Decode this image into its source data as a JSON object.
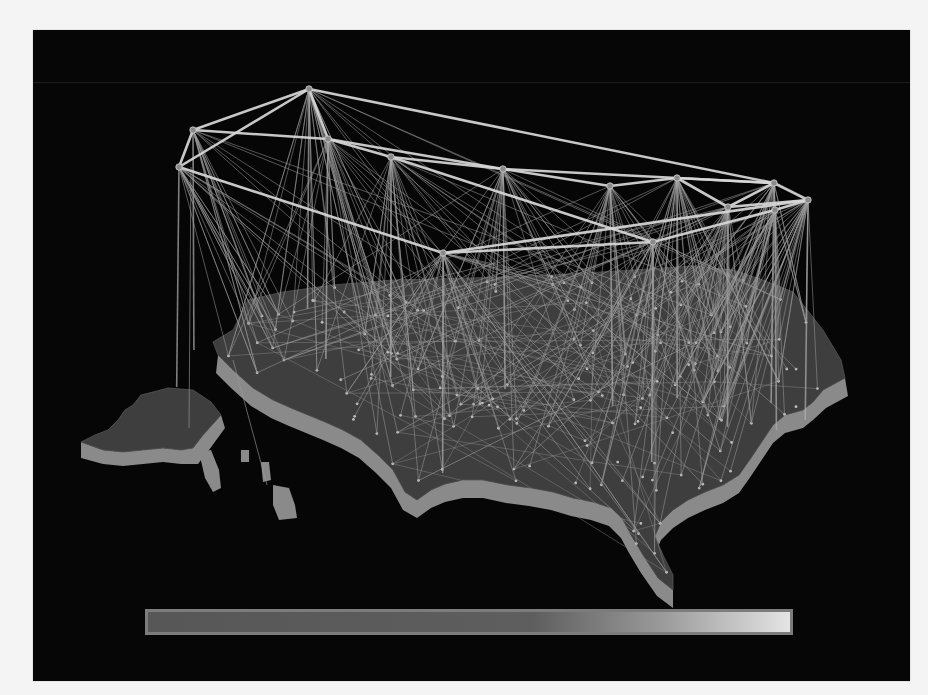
{
  "figure": {
    "type": "3d-network-map",
    "colors": {
      "background": "#060606",
      "page": "#f4f4f4",
      "map_top": "#3e3e3e",
      "map_side": "#8a8a8a",
      "backbone_link": "#d8d8d8",
      "fanout_link": "#9a9a9a",
      "ground_link": "#8c8c8c"
    }
  },
  "color_scale": {
    "stops": [
      {
        "offset": 0,
        "color": "#575757"
      },
      {
        "offset": 0.6,
        "color": "#5e5e5e"
      },
      {
        "offset": 0.8,
        "color": "#9a9a9a"
      },
      {
        "offset": 1,
        "color": "#e4e4e4"
      }
    ]
  },
  "backbone_nodes": [
    {
      "id": "n1",
      "x": 276,
      "y": 59
    },
    {
      "id": "n2",
      "x": 160,
      "y": 100
    },
    {
      "id": "n3",
      "x": 146,
      "y": 137
    },
    {
      "id": "n4",
      "x": 295,
      "y": 109
    },
    {
      "id": "n5",
      "x": 358,
      "y": 127
    },
    {
      "id": "n6",
      "x": 470,
      "y": 139
    },
    {
      "id": "n7",
      "x": 577,
      "y": 156
    },
    {
      "id": "n8",
      "x": 644,
      "y": 148
    },
    {
      "id": "n9",
      "x": 695,
      "y": 177
    },
    {
      "id": "n10",
      "x": 741,
      "y": 153
    },
    {
      "id": "n11",
      "x": 742,
      "y": 180
    },
    {
      "id": "n12",
      "x": 775,
      "y": 170
    },
    {
      "id": "n13",
      "x": 410,
      "y": 223
    },
    {
      "id": "n14",
      "x": 620,
      "y": 212
    }
  ],
  "backbone_links": [
    [
      "n1",
      "n2"
    ],
    [
      "n1",
      "n3"
    ],
    [
      "n1",
      "n4"
    ],
    [
      "n1",
      "n10"
    ],
    [
      "n2",
      "n3"
    ],
    [
      "n2",
      "n4"
    ],
    [
      "n3",
      "n13"
    ],
    [
      "n4",
      "n5"
    ],
    [
      "n4",
      "n6"
    ],
    [
      "n5",
      "n6"
    ],
    [
      "n6",
      "n7"
    ],
    [
      "n7",
      "n8"
    ],
    [
      "n8",
      "n10"
    ],
    [
      "n8",
      "n9"
    ],
    [
      "n9",
      "n10"
    ],
    [
      "n10",
      "n12"
    ],
    [
      "n9",
      "n12"
    ],
    [
      "n11",
      "n12"
    ],
    [
      "n13",
      "n14"
    ],
    [
      "n14",
      "n11"
    ],
    [
      "n13",
      "n12"
    ],
    [
      "n6",
      "n10"
    ],
    [
      "n5",
      "n14"
    ]
  ],
  "map": {
    "mainland_top": "M 180 312 L 200 300 L 215 270 L 250 262 L 300 255 L 360 250 L 440 248 L 520 245 L 600 240 L 660 236 L 700 240 L 730 250 L 760 262 L 790 300 L 808 330 L 812 348 L 790 360 L 780 372 L 770 380 L 752 385 L 740 395 L 730 410 L 718 428 L 706 445 L 690 455 L 672 462 L 655 470 L 640 480 L 628 492 L 622 506 L 630 525 L 640 545 L 640 560 L 625 548 L 610 525 L 598 505 L 590 490 L 578 478 L 560 472 L 540 468 L 520 462 L 498 458 L 475 455 L 450 450 L 430 450 L 412 454 L 398 460 L 384 470 L 372 462 L 360 440 L 345 425 L 328 410 L 310 400 L 292 392 L 275 385 L 258 378 L 240 370 L 220 358 L 200 340 L 185 325 Z",
    "mainland_side": "M 185 325 L 200 340 L 220 358 L 240 370 L 258 378 L 275 385 L 292 392 L 310 400 L 328 410 L 345 425 L 360 440 L 372 462 L 384 470 L 398 460 L 412 454 L 430 450 L 450 450 L 475 455 L 498 458 L 520 462 L 540 468 L 560 472 L 578 478 L 590 490 L 598 505 L 610 525 L 625 548 L 640 560 L 640 578 L 624 566 L 608 543 L 596 523 L 588 508 L 576 496 L 558 490 L 538 486 L 518 480 L 496 476 L 473 473 L 450 468 L 430 468 L 412 472 L 398 478 L 384 488 L 370 480 L 358 458 L 343 443 L 326 428 L 308 418 L 290 410 L 273 403 L 256 396 L 238 388 L 218 376 L 198 358 L 183 343 Z M 790 360 L 812 348 L 815 366 L 793 378 L 780 390 L 770 398 L 752 403 L 740 413 L 730 428 L 718 446 L 706 463 L 690 473 L 672 480 L 655 488 L 640 498 L 628 510 L 622 524 L 622 506 L 628 492 L 640 480 L 655 470 L 672 462 L 690 455 L 706 445 L 718 428 L 730 410 L 740 395 L 752 385 L 770 380 L 780 372 Z",
    "alaska_top": "M 48 412 L 62 405 L 75 400 L 85 390 L 92 380 L 100 375 L 108 365 L 120 362 L 135 358 L 160 360 L 178 372 L 188 385 L 170 405 L 160 418 L 148 420 L 130 418 L 110 420 L 90 422 L 70 420 Z",
    "alaska_side": "M 48 412 L 70 420 L 90 422 L 110 420 L 130 418 L 148 420 L 160 418 L 170 405 L 188 385 L 192 398 L 176 420 L 165 434 L 148 434 L 130 432 L 110 434 L 90 436 L 70 434 L 48 428 Z",
    "alaska_panhandle": "M 166 422 L 178 420 L 186 440 L 188 458 L 180 462 L 172 448 Z",
    "hawaii": [
      "M 208 420 L 216 420 L 216 432 L 208 432 Z",
      "M 228 432 L 236 432 L 238 450 L 230 452 Z",
      "M 240 455 L 256 458 L 262 475 L 264 488 L 246 490 L 240 475 Z"
    ]
  },
  "ground_sites_count": 180
}
